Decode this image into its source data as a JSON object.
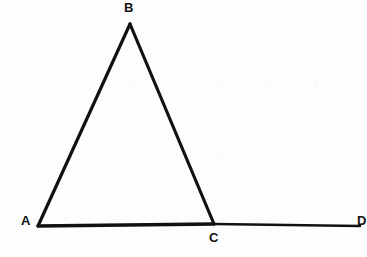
{
  "figure": {
    "caption_present": false,
    "background_color": "#fdfdfd",
    "ink_color": "#111111",
    "ghost_text": {
      "line1": "                   ",
      "line2": "                   "
    },
    "labels": {
      "a": "A",
      "b": "B",
      "c": "C",
      "d": "D"
    }
  },
  "chart_data": {
    "type": "diagram",
    "title": "",
    "xlabel": "",
    "ylabel": "",
    "points": [
      {
        "name": "A",
        "x": 38,
        "y": 226,
        "label": "A",
        "label_position": "left"
      },
      {
        "name": "B",
        "x": 130,
        "y": 24,
        "label": "B",
        "label_position": "above"
      },
      {
        "name": "C",
        "x": 214,
        "y": 224,
        "label": "C",
        "label_position": "below"
      },
      {
        "name": "D",
        "x": 360,
        "y": 226,
        "label": "D",
        "label_position": "right"
      }
    ],
    "segments": [
      {
        "name": "AB",
        "from": "A",
        "to": "B",
        "stroke_width": 3.2
      },
      {
        "name": "BC",
        "from": "B",
        "to": "C",
        "stroke_width": 3.2
      },
      {
        "name": "AC",
        "from": "A",
        "to": "C",
        "stroke_width": 3.4
      },
      {
        "name": "CD",
        "from": "C",
        "to": "D",
        "stroke_width": 2.4
      }
    ],
    "grid": false,
    "legend": null
  }
}
